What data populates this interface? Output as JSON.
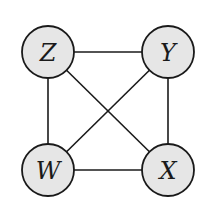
{
  "diagram": {
    "type": "graph",
    "directed": false,
    "nodes": [
      {
        "id": "Z",
        "label": "Z",
        "cx": 48,
        "cy": 52
      },
      {
        "id": "Y",
        "label": "Y",
        "cx": 168,
        "cy": 52
      },
      {
        "id": "W",
        "label": "W",
        "cx": 48,
        "cy": 170
      },
      {
        "id": "X",
        "label": "X",
        "cx": 168,
        "cy": 170
      }
    ],
    "edges": [
      {
        "from": "Z",
        "to": "Y"
      },
      {
        "from": "Z",
        "to": "W"
      },
      {
        "from": "Z",
        "to": "X"
      },
      {
        "from": "Y",
        "to": "W"
      },
      {
        "from": "Y",
        "to": "X"
      },
      {
        "from": "W",
        "to": "X"
      }
    ],
    "colors": {
      "node_fill": "#e6e6e6",
      "stroke": "#1a1a1a",
      "background": "#ffffff"
    }
  }
}
